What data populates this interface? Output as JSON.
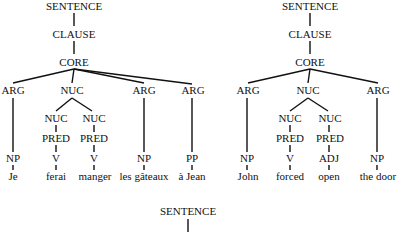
{
  "diagram": {
    "type": "syntactic-trees",
    "trees": [
      {
        "id": "french",
        "nodes": {
          "sentence": "SENTENCE",
          "clause": "CLAUSE",
          "core": "CORE",
          "arg1": "ARG",
          "nuc": "NUC",
          "arg2": "ARG",
          "arg3": "ARG",
          "nuc1": "NUC",
          "nuc2": "NUC",
          "pred1": "PRED",
          "pred2": "PRED",
          "v1": "V",
          "v2": "V",
          "np1": "NP",
          "np2": "NP",
          "pp": "PP"
        },
        "words": {
          "w1": "Je",
          "w2": "ferai",
          "w3": "manger",
          "w4": "les gâteaux",
          "w5": "à Jean"
        }
      },
      {
        "id": "english",
        "nodes": {
          "sentence": "SENTENCE",
          "clause": "CLAUSE",
          "core": "CORE",
          "arg1": "ARG",
          "nuc": "NUC",
          "arg2": "ARG",
          "nuc1": "NUC",
          "nuc2": "NUC",
          "pred1": "PRED",
          "pred2": "PRED",
          "v": "V",
          "adj": "ADJ",
          "np1": "NP",
          "np2": "NP"
        },
        "words": {
          "w1": "John",
          "w2": "forced",
          "w3": "open",
          "w4": "the door"
        }
      },
      {
        "id": "partial",
        "nodes": {
          "sentence": "SENTENCE"
        }
      }
    ]
  }
}
